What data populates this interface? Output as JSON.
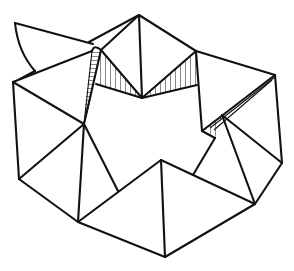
{
  "figure": {
    "type": "line-art polyhedral net / folded triangular structure",
    "stroke_color": "#111111",
    "background": "#ffffff",
    "hatched_regions": 3,
    "labels": []
  }
}
